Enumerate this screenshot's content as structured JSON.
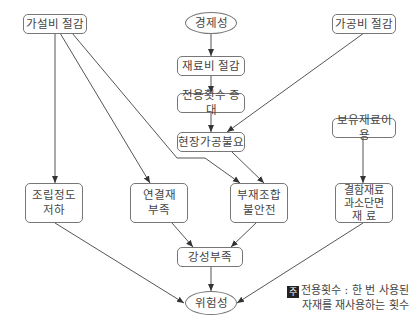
{
  "diagram": {
    "nodes": {
      "temp_cost": "가설비 절감",
      "economy": "경제성",
      "material_cost": "재료비 절감",
      "reuse_increase": "전용횟수 증대",
      "no_site_processing": "현장가공불요",
      "processing_cost": "가공비 절감",
      "owned_material": "보유재료이용",
      "assembly_precision": "조립정도\n저하",
      "connector_shortage": "연결재\n부족",
      "member_unstable": "부재조합\n불안전",
      "defect_material": "결함재료\n과소단면\n재     료",
      "stiffness_shortage": "강성부족",
      "danger": "위험성"
    },
    "edges": [
      [
        "economy",
        "material_cost"
      ],
      [
        "material_cost",
        "reuse_increase"
      ],
      [
        "reuse_increase",
        "no_site_processing"
      ],
      [
        "processing_cost",
        "no_site_processing"
      ],
      [
        "temp_cost",
        "assembly_precision"
      ],
      [
        "temp_cost",
        "connector_shortage"
      ],
      [
        "temp_cost",
        "member_unstable"
      ],
      [
        "no_site_processing",
        "member_unstable"
      ],
      [
        "owned_material",
        "defect_material"
      ],
      [
        "connector_shortage",
        "stiffness_shortage"
      ],
      [
        "member_unstable",
        "stiffness_shortage"
      ],
      [
        "assembly_precision",
        "danger"
      ],
      [
        "stiffness_shortage",
        "danger"
      ],
      [
        "defect_material",
        "danger"
      ]
    ],
    "note": {
      "badge": "주",
      "line1": "전용횟수 : 한 번 사용된",
      "line2": "자재를 재사용하는 횟수"
    }
  }
}
